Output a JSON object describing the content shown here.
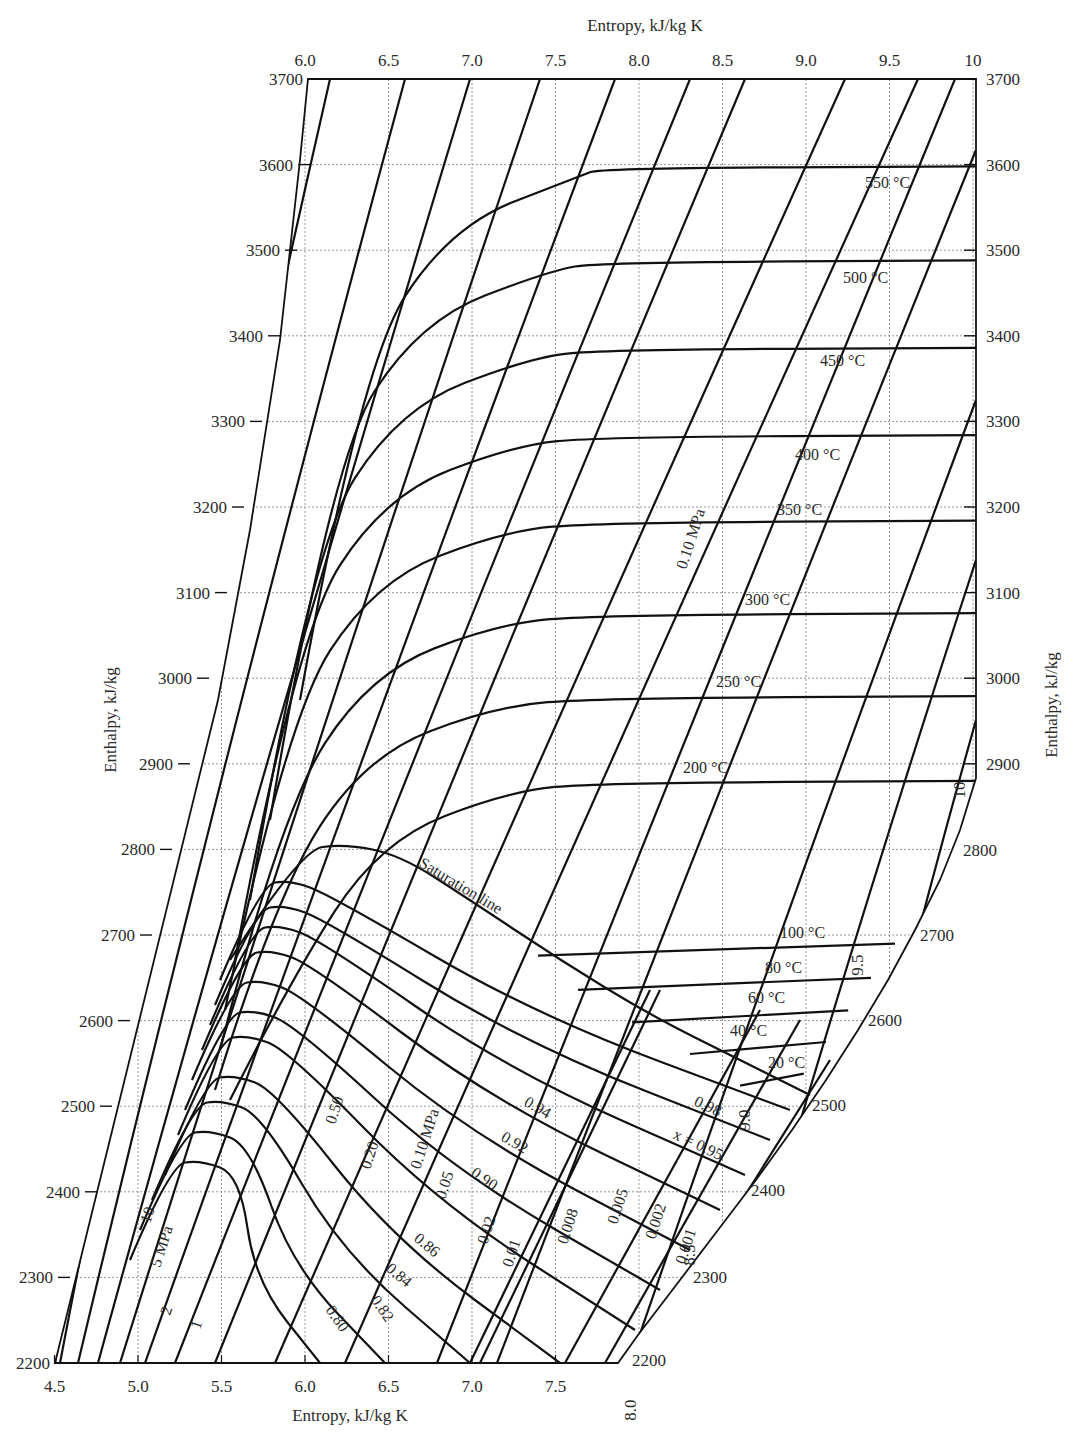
{
  "chart_data": {
    "type": "line",
    "xlabel": "Entropy, kJ/kg K",
    "ylabel": "Enthalpy, kJ/kg",
    "x_top_label": "Entropy, kJ/kg K",
    "y_right_label": "Enthalpy, kJ/kg",
    "xlim": [
      4.5,
      10
    ],
    "ylim": [
      2200,
      3700
    ],
    "grid": true,
    "x_top_ticks": [
      "6.0",
      "6.5",
      "7.0",
      "7.5",
      "8.0",
      "8.5",
      "9.0",
      "9.5",
      "10"
    ],
    "x_bottom_ticks": [
      "4.5",
      "5.0",
      "5.5",
      "6.0",
      "6.5",
      "7.0",
      "7.5"
    ],
    "x_right_slant_ticks": [
      "8.0",
      "8.5",
      "9.0",
      "9.5",
      "10"
    ],
    "y_left_ticks": [
      "2200",
      "2300",
      "2400",
      "2500",
      "2600",
      "2700",
      "2800",
      "2900",
      "3000",
      "3100",
      "3200",
      "3300",
      "3400",
      "3500",
      "3600",
      "3700"
    ],
    "y_right_ticks": [
      "2900",
      "3000",
      "3100",
      "3200",
      "3300",
      "3400",
      "3500",
      "3600",
      "3700"
    ],
    "y_right_slant_ticks": [
      "2200",
      "2300",
      "2400",
      "2500",
      "2600",
      "2700",
      "2800"
    ],
    "saturation_line_label": "Saturation line",
    "isotherms": [
      {
        "name": "550 °C",
        "h_flat": 3598
      },
      {
        "name": "500 °C",
        "h_flat": 3488
      },
      {
        "name": "450 °C",
        "h_flat": 3386
      },
      {
        "name": "400 °C",
        "h_flat": 3284
      },
      {
        "name": "350 °C",
        "h_flat": 3184
      },
      {
        "name": "300 °C",
        "h_flat": 3076
      },
      {
        "name": "250 °C",
        "h_flat": 2979
      },
      {
        "name": "200 °C",
        "h_flat": 2880
      },
      {
        "name": "100 °C",
        "h_flat": 2690
      },
      {
        "name": "80 °C",
        "h_flat": 2650
      },
      {
        "name": "60 °C",
        "h_flat": 2612
      },
      {
        "name": "40 °C",
        "h_flat": 2575
      },
      {
        "name": "20 °C",
        "h_flat": 2538
      }
    ],
    "isobars_MPa": [
      "10",
      "5 MPa",
      "2",
      "1",
      "0.50",
      "0.20",
      "0.10 MPa",
      "0.05",
      "0.02",
      "0.01",
      "0.008",
      "0.005",
      "0.002",
      "0.001"
    ],
    "isobar_upper_label": "0.10 MPa",
    "quality_lines": [
      "0.80",
      "0.82",
      "0.84",
      "0.86",
      "0.90",
      "0.92",
      "0.94",
      "x = 0.95",
      "0.98"
    ]
  }
}
